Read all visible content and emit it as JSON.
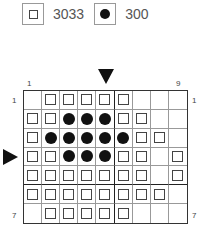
{
  "legend": [
    {
      "symbol": "square",
      "label": "3033"
    },
    {
      "symbol": "dot",
      "label": "300"
    }
  ],
  "chart": {
    "columns": 9,
    "rows": 7,
    "col_labels": {
      "first": "1",
      "last": "9"
    },
    "row_labels": {
      "first": "1",
      "last": "7"
    },
    "center_column_marker": "arrow-down at column 5",
    "center_row_marker": "arrow-right at row 4",
    "grid": [
      [
        "",
        "sq",
        "sq",
        "sq",
        "sq",
        "sq",
        "",
        "",
        ""
      ],
      [
        "sq",
        "sq",
        "dot",
        "dot",
        "dot",
        "sq",
        "sq",
        "",
        ""
      ],
      [
        "sq",
        "dot",
        "dot",
        "dot",
        "dot",
        "dot",
        "sq",
        "sq",
        ""
      ],
      [
        "sq",
        "sq",
        "dot",
        "dot",
        "dot",
        "sq",
        "sq",
        "",
        "sq"
      ],
      [
        "sq",
        "sq",
        "sq",
        "sq",
        "sq",
        "sq",
        "sq",
        "",
        "sq"
      ],
      [
        "sq",
        "sq",
        "sq",
        "sq",
        "sq",
        "sq",
        "sq",
        "sq",
        ""
      ],
      [
        "",
        "sq",
        "sq",
        "sq",
        "sq",
        "sq",
        "",
        "",
        ""
      ]
    ]
  }
}
